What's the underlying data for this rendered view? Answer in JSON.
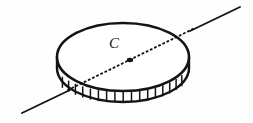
{
  "figure": {
    "name": "rotating-disk-with-axis",
    "background_color": "#fefefe",
    "ink_color": "#141414",
    "labels": {
      "center_point": "C"
    },
    "geometry": {
      "canvas_width": 253,
      "canvas_height": 123,
      "disk": {
        "center_x": 123,
        "top_face_center_y": 57,
        "radius_x": 66,
        "radius_y": 34,
        "rim_thickness": 11,
        "teeth_count": 22
      },
      "center_dot": {
        "x": 130,
        "y": 60,
        "radius": 2.6
      },
      "axis_line": {
        "start_x": 22,
        "start_y": 113,
        "end_x": 238,
        "end_y": 8,
        "dotted_from_x": 68,
        "dotted_from_y": 90,
        "dotted_to_x": 192,
        "dotted_to_y": 30,
        "stroke_width": 1.8,
        "dot_pattern": "1.2 3.4"
      }
    }
  }
}
